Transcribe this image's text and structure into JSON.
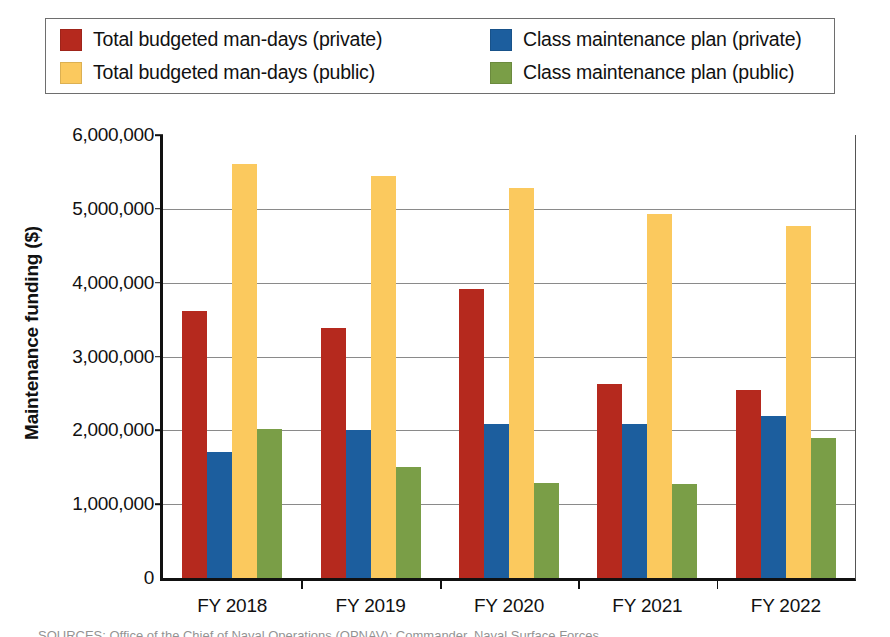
{
  "legend": {
    "entries": [
      {
        "label": "Total budgeted man-days (private)",
        "color": "#B5291E",
        "icon": "legend-swatch-icon"
      },
      {
        "label": "Class maintenance plan (private)",
        "color": "#1C5E9E",
        "icon": "legend-swatch-icon"
      },
      {
        "label": "Total budgeted man-days (public)",
        "color": "#FBC95E",
        "icon": "legend-swatch-icon"
      },
      {
        "label": "Class maintenance plan (public)",
        "color": "#7A9E47",
        "icon": "legend-swatch-icon"
      }
    ]
  },
  "axis": {
    "y_title": "Maintenance funding ($)",
    "y_ticks": [
      "6,000,000",
      "5,000,000",
      "4,000,000",
      "3,000,000",
      "2,000,000",
      "1,000,000",
      "0"
    ],
    "x_ticks": [
      "FY 2018",
      "FY 2019",
      "FY 2020",
      "FY 2021",
      "FY 2022"
    ]
  },
  "caption": "SOURCES: Office of the Chief of Naval Operations (OPNAV); Commander, Naval Surface Forces",
  "chart_data": {
    "type": "bar",
    "title": "",
    "xlabel": "",
    "ylabel": "Maintenance funding ($)",
    "ylim": [
      0,
      6000000
    ],
    "ytick_step": 1000000,
    "grid": true,
    "legend_position": "top",
    "categories": [
      "FY 2018",
      "FY 2019",
      "FY 2020",
      "FY 2021",
      "FY 2022"
    ],
    "series": [
      {
        "name": "Total budgeted man-days (private)",
        "color": "#B5291E",
        "values": [
          3620000,
          3380000,
          3910000,
          2630000,
          2540000
        ]
      },
      {
        "name": "Class maintenance plan (private)",
        "color": "#1C5E9E",
        "values": [
          1710000,
          2010000,
          2090000,
          2080000,
          2190000
        ]
      },
      {
        "name": "Total budgeted man-days (public)",
        "color": "#FBC95E",
        "values": [
          5610000,
          5440000,
          5280000,
          4930000,
          4770000
        ]
      },
      {
        "name": "Class maintenance plan (public)",
        "color": "#7A9E47",
        "values": [
          2020000,
          1500000,
          1290000,
          1280000,
          1900000
        ]
      }
    ]
  }
}
